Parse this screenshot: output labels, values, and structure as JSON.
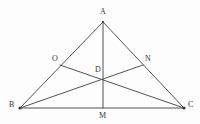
{
  "figure": {
    "canvas": {
      "width": 200,
      "height": 124
    },
    "background_color": "#fdfdfd",
    "line_color": "#555354",
    "label_color": "#3a3839",
    "points": [
      {
        "id": "A",
        "label": "A",
        "x": 103,
        "y": 22,
        "label_x": 100,
        "label_y": 8,
        "role": "apex-vertex"
      },
      {
        "id": "B",
        "label": "B",
        "x": 20,
        "y": 108,
        "label_x": 9,
        "label_y": 101,
        "role": "left-vertex"
      },
      {
        "id": "C",
        "label": "C",
        "x": 184,
        "y": 108,
        "label_x": 188,
        "label_y": 101,
        "role": "right-vertex"
      },
      {
        "id": "M",
        "label": "M",
        "x": 103,
        "y": 108,
        "label_x": 99,
        "label_y": 112,
        "role": "midpoint-of-BC"
      },
      {
        "id": "O",
        "label": "O",
        "x": 60,
        "y": 65,
        "label_x": 52,
        "label_y": 55,
        "role": "point-on-AB"
      },
      {
        "id": "N",
        "label": "N",
        "x": 143,
        "y": 65,
        "label_x": 145,
        "label_y": 55,
        "role": "point-on-AC"
      },
      {
        "id": "D",
        "label": "D",
        "x": 103,
        "y": 78,
        "label_x": 95,
        "label_y": 66,
        "role": "intersection-of-cevians"
      }
    ],
    "segments": [
      {
        "id": "AB",
        "from": "A",
        "to": "B",
        "kind": "triangle-side"
      },
      {
        "id": "AC",
        "from": "A",
        "to": "C",
        "kind": "triangle-side"
      },
      {
        "id": "BC",
        "from": "B",
        "to": "C",
        "kind": "triangle-base"
      },
      {
        "id": "AM",
        "from": "A",
        "to": "M",
        "kind": "cevian-median"
      },
      {
        "id": "BN",
        "from": "B",
        "to": "N",
        "kind": "cevian"
      },
      {
        "id": "OC",
        "from": "O",
        "to": "C",
        "kind": "cevian"
      }
    ]
  }
}
